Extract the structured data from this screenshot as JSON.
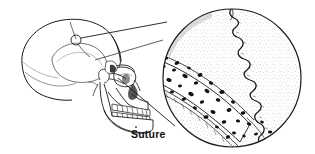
{
  "figure": {
    "name": "suture-illustration",
    "title": "Suture",
    "background_color": "#ffffff",
    "ink_color": "#1a1a1a",
    "stipple_color": "#8a8a8a",
    "labels": [
      {
        "id": "suture",
        "text": "Suture",
        "x": 131,
        "y": 129,
        "bold": true,
        "font_size": 10.5
      }
    ],
    "parts": [
      {
        "id": "skull",
        "name": "skull-lateral-view",
        "description": "Lateral view of human skull"
      },
      {
        "id": "cranium",
        "name": "cranium",
        "description": "Braincase with stippled shading"
      },
      {
        "id": "mandible",
        "name": "mandible",
        "description": "Lower jaw bone"
      },
      {
        "id": "maxilla",
        "name": "maxilla",
        "description": "Upper jaw with teeth"
      },
      {
        "id": "teeth",
        "name": "teeth-row",
        "description": "Upper and lower rows of teeth"
      },
      {
        "id": "orbit",
        "name": "eye-orbit",
        "description": "Eye socket"
      },
      {
        "id": "nasal",
        "name": "nasal-aperture",
        "description": "Nasal opening"
      },
      {
        "id": "marker",
        "name": "suture-site-marker",
        "description": "Small circle marking the suture location on the skull"
      },
      {
        "id": "leader-upper",
        "name": "leader-line-upper",
        "description": "Upper magnification leader line"
      },
      {
        "id": "leader-lower",
        "name": "leader-line-lower",
        "description": "Lower magnification leader line"
      },
      {
        "id": "inset",
        "name": "magnified-inset-circle",
        "description": "Circular magnified view of the suture"
      },
      {
        "id": "suture-line",
        "name": "suture-interlocking-line",
        "description": "Wavy interlocking suture joint line"
      },
      {
        "id": "compact-bone",
        "name": "compact-bone-stipple",
        "description": "Stippled compact bone surface"
      },
      {
        "id": "diploe",
        "name": "diploe-spongy-bone",
        "description": "Band of spongy bone with dark marrow spaces"
      }
    ],
    "inset_circle": {
      "center_x": 232,
      "center_y": 78,
      "radius": 70
    },
    "marker_circle": {
      "center_x": 76,
      "center_y": 40,
      "radius": 5
    }
  }
}
